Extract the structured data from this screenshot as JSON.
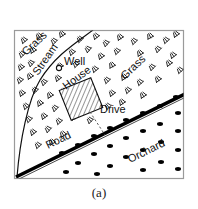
{
  "figure": {
    "caption": "(a)",
    "frame_color": "#9a9a9a",
    "background_color": "#ffffff",
    "ink_color": "#111111"
  },
  "map": {
    "labels": {
      "grass_left": "Grass",
      "grass_right": "Grass",
      "stream": "Stream",
      "well": "Well",
      "house": "House",
      "drive": "Drive",
      "road": "Road",
      "orchard": "Orchard"
    },
    "features": [
      {
        "name": "grass-area-left",
        "kind": "grass",
        "label": "Grass"
      },
      {
        "name": "grass-area-right",
        "kind": "grass",
        "label": "Grass"
      },
      {
        "name": "stream-line",
        "kind": "stream",
        "label": "Stream"
      },
      {
        "name": "well-point",
        "kind": "point",
        "label": "Well",
        "symbol": "circle"
      },
      {
        "name": "house-polygon",
        "kind": "building",
        "label": "House",
        "fill": "hatch"
      },
      {
        "name": "drive-line",
        "kind": "path",
        "label": "Drive",
        "style": "dashed"
      },
      {
        "name": "road-line",
        "kind": "road",
        "label": "Road",
        "style": "thick-band"
      },
      {
        "name": "orchard-area",
        "kind": "orchard",
        "label": "Orchard",
        "symbol": "dots"
      }
    ]
  }
}
